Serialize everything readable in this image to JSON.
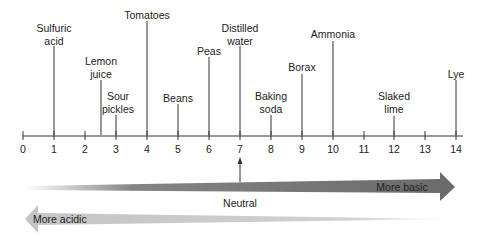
{
  "diagram": {
    "axis": {
      "min": 0,
      "max": 14,
      "ticks": [
        "0",
        "1",
        "2",
        "3",
        "4",
        "5",
        "6",
        "7",
        "8",
        "9",
        "10",
        "11",
        "12",
        "13",
        "14"
      ]
    },
    "substances": [
      {
        "id": "sulfuric-acid",
        "lines": [
          "Sulfuric",
          "acid"
        ],
        "ph": 1
      },
      {
        "id": "lemon-juice",
        "lines": [
          "Lemon",
          "juice"
        ],
        "ph": 2.5
      },
      {
        "id": "sour-pickles",
        "lines": [
          "Sour",
          "pickles"
        ],
        "ph": 3
      },
      {
        "id": "tomatoes",
        "lines": [
          "Tomatoes"
        ],
        "ph": 4
      },
      {
        "id": "beans",
        "lines": [
          "Beans"
        ],
        "ph": 5
      },
      {
        "id": "peas",
        "lines": [
          "Peas"
        ],
        "ph": 6
      },
      {
        "id": "distilled-water",
        "lines": [
          "Distilled",
          "water"
        ],
        "ph": 7
      },
      {
        "id": "baking-soda",
        "lines": [
          "Baking",
          "soda"
        ],
        "ph": 8
      },
      {
        "id": "borax",
        "lines": [
          "Borax"
        ],
        "ph": 9
      },
      {
        "id": "ammonia",
        "lines": [
          "Ammonia"
        ],
        "ph": 10
      },
      {
        "id": "slaked-lime",
        "lines": [
          "Slaked",
          "lime"
        ],
        "ph": 12
      },
      {
        "id": "lye",
        "lines": [
          "Lye"
        ],
        "ph": 14
      }
    ],
    "neutral_label": "Neutral",
    "basic_arrow_label": "More basic",
    "acidic_arrow_label": "More acidic",
    "colors": {
      "basic_arrow": "#6e6e6e",
      "acidic_arrow": "#c4c4c4",
      "line": "#333333"
    }
  }
}
